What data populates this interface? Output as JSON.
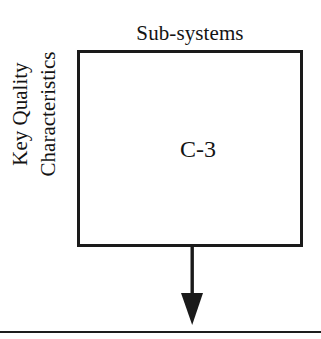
{
  "diagram": {
    "type": "qfd-matrix-deployment",
    "background_color": "#ffffff",
    "line_color": "#1a1a1a",
    "column_header": "Sub-systems",
    "row_header": {
      "line1": "Key Quality",
      "line2": "Characteristics",
      "orientation": "rotated-90-ccw"
    },
    "matrix": {
      "cell_label": "C-3",
      "border_width_px": 3
    },
    "arrow": {
      "name": "down-arrow",
      "direction": "down",
      "from": "matrix-box-bottom",
      "to": "bottom-rule"
    },
    "bottom_rule": {
      "name": "bottom-divider",
      "full_width": true
    }
  }
}
